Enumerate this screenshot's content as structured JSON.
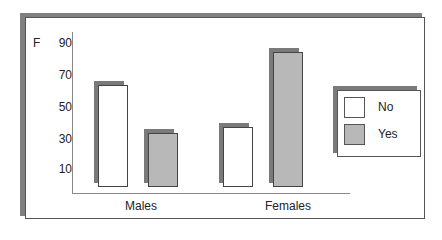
{
  "chart_data": {
    "type": "bar",
    "title": "",
    "xlabel": "",
    "ylabel": "F",
    "categories": [
      "Males",
      "Females"
    ],
    "series": [
      {
        "name": "No",
        "values": [
          63,
          37
        ],
        "color": "#ffffff"
      },
      {
        "name": "Yes",
        "values": [
          33,
          84
        ],
        "color": "#b8b8b8"
      }
    ],
    "yticks": [
      10,
      30,
      50,
      70,
      90
    ],
    "ylim": [
      0,
      95
    ],
    "grid": false,
    "legend_position": "right"
  },
  "colors": {
    "shadow": "#7a7a7a",
    "no_fill": "#ffffff",
    "yes_fill": "#b8b8b8",
    "border": "#444444"
  }
}
